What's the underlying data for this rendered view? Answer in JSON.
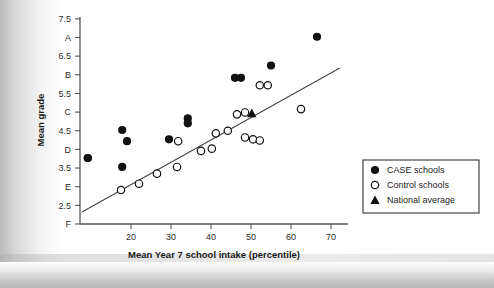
{
  "chart_data": {
    "type": "scatter",
    "title": "",
    "xlabel": "Mean Year 7 school intake (percentile)",
    "ylabel": "Mean grade",
    "xlim": [
      7.25,
      76
    ],
    "ylim": [
      2.0,
      7.5
    ],
    "xticks": [
      20,
      30,
      40,
      50,
      60,
      70
    ],
    "xtick_labels": [
      "20",
      "30",
      "40",
      "50",
      "60",
      "70"
    ],
    "yticks": [
      7.5,
      7.0,
      6.5,
      6.0,
      5.5,
      5.0,
      4.5,
      4.0,
      3.5,
      3.0,
      2.5,
      2.0
    ],
    "ytick_labels": [
      "7.5",
      "A",
      "6.5",
      "B",
      "5.5",
      "C",
      "4.5",
      "D",
      "3.5",
      "E",
      "2.5",
      "F"
    ],
    "grid": false,
    "legend_position": "right-outside",
    "series": [
      {
        "name": "CASE schools",
        "marker": "filled-circle",
        "color": "#111111",
        "points": [
          {
            "x": 9.2,
            "y": 3.77
          },
          {
            "x": 17.8,
            "y": 4.52
          },
          {
            "x": 19.0,
            "y": 4.22
          },
          {
            "x": 9.2,
            "y": 3.77
          },
          {
            "x": 17.8,
            "y": 3.53
          },
          {
            "x": 29.5,
            "y": 4.27
          },
          {
            "x": 34.2,
            "y": 4.83
          },
          {
            "x": 34.2,
            "y": 4.7
          },
          {
            "x": 46.0,
            "y": 5.92
          },
          {
            "x": 47.5,
            "y": 5.92
          },
          {
            "x": 55.0,
            "y": 6.25
          },
          {
            "x": 66.5,
            "y": 7.02
          }
        ]
      },
      {
        "name": "Control schools",
        "marker": "open-circle",
        "color": "#111111",
        "points": [
          {
            "x": 17.5,
            "y": 2.91
          },
          {
            "x": 22.0,
            "y": 3.08
          },
          {
            "x": 26.5,
            "y": 3.35
          },
          {
            "x": 31.5,
            "y": 3.53
          },
          {
            "x": 31.8,
            "y": 4.22
          },
          {
            "x": 37.5,
            "y": 3.96
          },
          {
            "x": 40.2,
            "y": 4.02
          },
          {
            "x": 41.2,
            "y": 4.43
          },
          {
            "x": 44.2,
            "y": 4.5
          },
          {
            "x": 46.5,
            "y": 4.94
          },
          {
            "x": 48.5,
            "y": 4.99
          },
          {
            "x": 48.5,
            "y": 4.32
          },
          {
            "x": 50.5,
            "y": 4.27
          },
          {
            "x": 52.2,
            "y": 5.72
          },
          {
            "x": 54.2,
            "y": 5.72
          },
          {
            "x": 52.2,
            "y": 4.24
          },
          {
            "x": 62.5,
            "y": 5.08
          }
        ]
      },
      {
        "name": "National average",
        "marker": "triangle",
        "color": "#111111",
        "points": [
          {
            "x": 50.2,
            "y": 4.97
          }
        ]
      }
    ],
    "trendline": {
      "name": "regression line",
      "x0": 7.75,
      "y0": 2.32,
      "x1": 72.2,
      "y1": 6.18
    }
  },
  "legend": {
    "items": [
      {
        "label": "CASE schools",
        "marker": "filled-circle"
      },
      {
        "label": "Control schools",
        "marker": "open-circle"
      },
      {
        "label": "National average",
        "marker": "triangle"
      }
    ]
  }
}
